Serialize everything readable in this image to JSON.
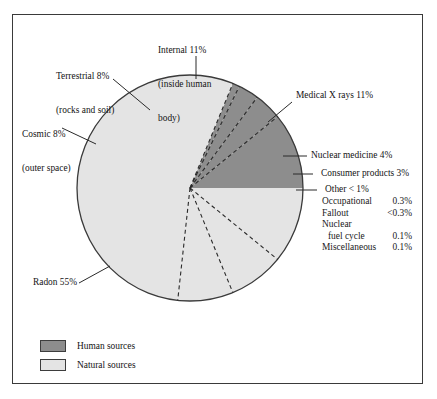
{
  "chart_data": {
    "type": "pie",
    "title": "",
    "total_label": "",
    "legend_position": "bottom-left",
    "categories": [
      "Medical X rays",
      "Nuclear medicine",
      "Consumer products",
      "Other",
      "Radon",
      "Cosmic",
      "Terrestrial",
      "Internal"
    ],
    "values": [
      11,
      4,
      3,
      1,
      55,
      8,
      8,
      11
    ],
    "slices": [
      {
        "label": "Medical X rays 11%",
        "name": "Medical X rays",
        "value": 11,
        "group": "human",
        "color": "#8d8d8d"
      },
      {
        "label": "Nuclear medicine 4%",
        "name": "Nuclear medicine",
        "value": 4,
        "group": "human",
        "color": "#8d8d8d"
      },
      {
        "label": "Consumer products 3%",
        "name": "Consumer products",
        "value": 3,
        "group": "human",
        "color": "#8d8d8d"
      },
      {
        "label": "Other < 1%",
        "name": "Other",
        "value": 1,
        "group": "human",
        "color": "#8d8d8d"
      },
      {
        "label": "Radon 55%",
        "name": "Radon",
        "value": 55,
        "group": "natural",
        "color": "#e4e4e4"
      },
      {
        "label": "Cosmic 8%",
        "name": "Cosmic",
        "value": 8,
        "group": "natural",
        "color": "#e4e4e4"
      },
      {
        "label": "Terrestrial 8%",
        "name": "Terrestrial",
        "value": 8,
        "group": "natural",
        "color": "#e4e4e4"
      },
      {
        "label": "Internal 11%",
        "name": "Internal",
        "value": 11,
        "group": "natural",
        "color": "#e4e4e4"
      }
    ],
    "annotations": [
      "Terrestrial 8% (rocks and soil)",
      "Internal 11% (inside human body)",
      "Cosmic 8% (outer space)",
      "Medical X rays 11%",
      "Nuclear medicine 4%",
      "Consumer products 3%",
      "Other < 1%",
      "Radon 55%"
    ]
  },
  "labels": {
    "internal": {
      "line1": "Internal 11%",
      "line2": "(inside human",
      "line3": "body)"
    },
    "terrestrial": {
      "line1": "Terrestrial 8%",
      "line2": "(rocks and soil)"
    },
    "cosmic": {
      "line1": "Cosmic 8%",
      "line2": "(outer space)"
    },
    "medical_xrays": "Medical X rays 11%",
    "nuclear_medicine": "Nuclear medicine 4%",
    "consumer_products": "Consumer products 3%",
    "other": "Other < 1%",
    "radon": "Radon 55%"
  },
  "other_breakdown": {
    "rows": [
      {
        "name": "Occupational",
        "value": "0.3%"
      },
      {
        "name": "Fallout",
        "value": "<0.3%"
      },
      {
        "name": "Nuclear",
        "value": ""
      },
      {
        "name": "fuel cycle",
        "value": "0.1%"
      },
      {
        "name": "Miscellaneous",
        "value": "0.1%"
      }
    ]
  },
  "legend": {
    "items": [
      {
        "label": "Human sources",
        "color": "#8d8d8d"
      },
      {
        "label": "Natural sources",
        "color": "#e4e4e4"
      }
    ]
  },
  "colors": {
    "human_sources": "#8d8d8d",
    "natural_sources": "#e4e4e4",
    "outline": "#3a3a3a",
    "text": "#141414",
    "background": "#ffffff"
  }
}
